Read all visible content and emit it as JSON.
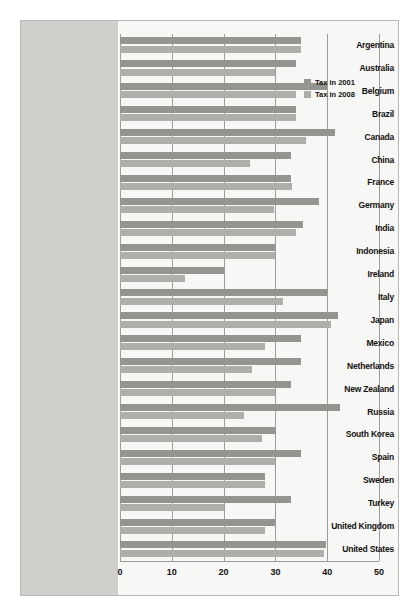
{
  "chart_data": {
    "type": "bar",
    "orientation": "horizontal",
    "title": "",
    "xlabel": "",
    "ylabel": "",
    "xlim": [
      0,
      50
    ],
    "xticks": [
      0,
      10,
      20,
      30,
      40,
      50
    ],
    "xtick_labels": [
      "0",
      "10",
      "20",
      "30",
      "40",
      "50"
    ],
    "grid": true,
    "legend_position": "upper right",
    "categories": [
      "Argentina",
      "Australia",
      "Belgium",
      "Brazil",
      "Canada",
      "China",
      "France",
      "Germany",
      "India",
      "Indonesia",
      "Ireland",
      "Italy",
      "Japan",
      "Mexico",
      "Netherlands",
      "New Zealand",
      "Russia",
      "South Korea",
      "Spain",
      "Sweden",
      "Turkey",
      "United Kingdom",
      "United States"
    ],
    "series": [
      {
        "name": "Tax in 2001",
        "color": "#949490",
        "values": [
          35,
          34,
          40,
          34,
          41.6,
          33,
          33,
          38.4,
          35.3,
          30,
          20,
          40,
          42,
          35,
          35,
          33,
          42.4,
          30.2,
          35,
          28,
          33,
          30,
          39.8
        ]
      },
      {
        "name": "Tax in 2008",
        "color": "#aeaeaa",
        "values": [
          35,
          30,
          34,
          34,
          36,
          25,
          33.3,
          29.8,
          33.9,
          30,
          12.5,
          31.4,
          40.7,
          28,
          25.5,
          30,
          24,
          27.5,
          30,
          28,
          20,
          28,
          39.3
        ]
      }
    ],
    "legend": [
      {
        "label": "Tax in 2001",
        "color": "#949490"
      },
      {
        "label": "Tax in 2008",
        "color": "#aeaeaa"
      }
    ]
  }
}
